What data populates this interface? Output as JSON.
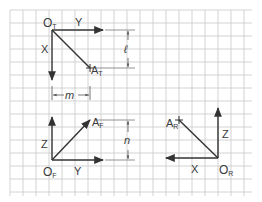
{
  "diagram": {
    "grid": {
      "x0": 10,
      "y0": 10,
      "x1": 252,
      "y1": 196,
      "cell": 13,
      "color": "#c8c8c8"
    },
    "ink_color": "#333333",
    "top_view": {
      "origin_label": "O",
      "origin_sub": "T",
      "axis_horizontal": "Y",
      "axis_vertical": "X",
      "point_label": "A",
      "point_sub": "T",
      "dimension_label": "ℓ"
    },
    "front_view": {
      "origin_label": "O",
      "origin_sub": "F",
      "axis_horizontal": "Y",
      "axis_vertical": "Z",
      "point_label": "A",
      "point_sub": "F",
      "dimension_label": "n",
      "width_dimension_label": "m"
    },
    "right_view": {
      "origin_label": "O",
      "origin_sub": "R",
      "axis_horizontal": "X",
      "axis_vertical": "Z",
      "point_label": "A",
      "point_sub": "R"
    }
  }
}
